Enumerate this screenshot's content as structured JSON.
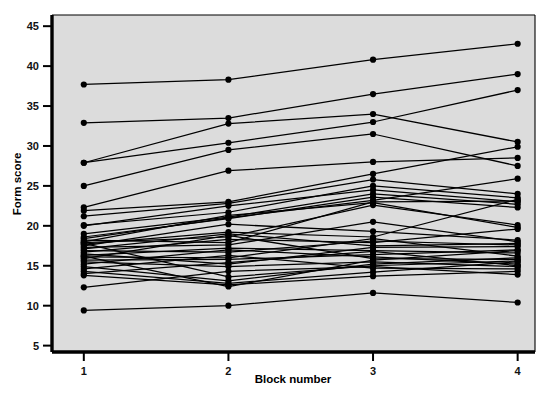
{
  "chart_data": {
    "type": "line",
    "title": "",
    "subtitle": "",
    "xlabel": "Block number",
    "ylabel": "Form score",
    "x": [
      1,
      2,
      3,
      4
    ],
    "xticklabels": [
      "1",
      "2",
      "3",
      "4"
    ],
    "yticks": [
      5,
      10,
      15,
      20,
      25,
      30,
      35,
      40,
      45
    ],
    "yticklabels": [
      "5",
      "10",
      "15",
      "20",
      "25",
      "30",
      "35",
      "40",
      "45"
    ],
    "xlim": [
      0.78,
      4.12
    ],
    "ylim": [
      4.2,
      46.4
    ],
    "grid": false,
    "legend": false,
    "legend_position": "none",
    "marker": "filled-circle",
    "plot_background": "#dcdcdc",
    "line_color": "#000000",
    "marker_color": "#000000",
    "frame_color": "#000000",
    "series_note": "Each line is one participant measured across four blocks",
    "series": [
      {
        "name": "s1",
        "values": [
          37.7,
          38.3,
          40.8,
          42.8
        ]
      },
      {
        "name": "s2",
        "values": [
          32.9,
          33.5,
          36.5,
          39.0
        ]
      },
      {
        "name": "s3",
        "values": [
          27.9,
          30.4,
          33.0,
          37.0
        ]
      },
      {
        "name": "s4",
        "values": [
          27.9,
          32.8,
          34.0,
          30.5
        ]
      },
      {
        "name": "s5",
        "values": [
          25.0,
          29.5,
          31.5,
          27.5
        ]
      },
      {
        "name": "s6",
        "values": [
          22.3,
          26.9,
          28.0,
          28.5
        ]
      },
      {
        "name": "s7",
        "values": [
          21.9,
          23.0,
          26.5,
          29.9
        ]
      },
      {
        "name": "s8",
        "values": [
          21.2,
          22.8,
          25.8,
          24.0
        ]
      },
      {
        "name": "s9",
        "values": [
          20.1,
          21.7,
          25.0,
          23.5
        ]
      },
      {
        "name": "s10",
        "values": [
          20.0,
          22.5,
          24.5,
          23.0
        ]
      },
      {
        "name": "s11",
        "values": [
          19.0,
          21.1,
          24.0,
          22.7
        ]
      },
      {
        "name": "s12",
        "values": [
          18.6,
          20.9,
          23.6,
          22.3
        ]
      },
      {
        "name": "s13",
        "values": [
          18.4,
          21.0,
          23.2,
          25.9
        ]
      },
      {
        "name": "s14",
        "values": [
          18.2,
          17.9,
          23.0,
          23.1
        ]
      },
      {
        "name": "s15",
        "values": [
          18.0,
          21.3,
          22.9,
          19.8
        ]
      },
      {
        "name": "s16",
        "values": [
          17.9,
          18.6,
          22.6,
          20.1
        ]
      },
      {
        "name": "s17",
        "values": [
          17.7,
          19.2,
          18.6,
          23.3
        ]
      },
      {
        "name": "s18",
        "values": [
          17.5,
          20.2,
          19.3,
          18.2
        ]
      },
      {
        "name": "s19",
        "values": [
          17.3,
          17.6,
          20.5,
          18.0
        ]
      },
      {
        "name": "s20",
        "values": [
          17.1,
          19.0,
          17.5,
          17.8
        ]
      },
      {
        "name": "s21",
        "values": [
          16.9,
          16.7,
          18.1,
          17.6
        ]
      },
      {
        "name": "s22",
        "values": [
          16.7,
          18.3,
          17.9,
          19.6
        ]
      },
      {
        "name": "s23",
        "values": [
          16.5,
          15.2,
          17.3,
          17.4
        ]
      },
      {
        "name": "s24",
        "values": [
          16.3,
          17.2,
          16.9,
          16.6
        ]
      },
      {
        "name": "s25",
        "values": [
          16.1,
          16.0,
          18.4,
          16.2
        ]
      },
      {
        "name": "s26",
        "values": [
          15.9,
          18.8,
          15.9,
          15.8
        ]
      },
      {
        "name": "s27",
        "values": [
          15.7,
          15.8,
          16.4,
          17.0
        ]
      },
      {
        "name": "s28",
        "values": [
          15.5,
          14.9,
          15.5,
          14.9
        ]
      },
      {
        "name": "s29",
        "values": [
          15.2,
          17.0,
          16.1,
          15.2
        ]
      },
      {
        "name": "s30",
        "values": [
          14.9,
          13.1,
          15.2,
          16.0
        ]
      },
      {
        "name": "s31",
        "values": [
          14.6,
          16.3,
          14.7,
          14.6
        ]
      },
      {
        "name": "s32",
        "values": [
          14.3,
          12.8,
          14.2,
          15.5
        ]
      },
      {
        "name": "s33",
        "values": [
          14.0,
          15.4,
          16.8,
          15.0
        ]
      },
      {
        "name": "s34",
        "values": [
          13.8,
          12.6,
          13.7,
          14.3
        ]
      },
      {
        "name": "s35",
        "values": [
          16.2,
          12.4,
          15.7,
          16.9
        ]
      },
      {
        "name": "s36",
        "values": [
          12.3,
          14.3,
          14.9,
          13.9
        ]
      },
      {
        "name": "s37",
        "values": [
          17.8,
          13.6,
          15.0,
          15.6
        ]
      },
      {
        "name": "s38",
        "values": [
          9.4,
          10.0,
          11.6,
          10.4
        ]
      }
    ]
  }
}
